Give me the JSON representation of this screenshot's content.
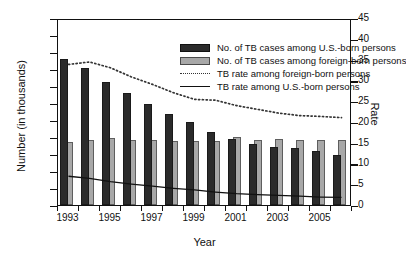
{
  "chart_data": {
    "type": "bar",
    "title": "",
    "xlabel": "Year",
    "ylabel": "Number (in thousands)",
    "ylabel_right": "Rate",
    "grid": false,
    "legend_position": "top-center",
    "ylim": [
      0,
      22
    ],
    "ylim_right": [
      0,
      45
    ],
    "ytick_step": 2,
    "ytick_right_step": 5,
    "yticks": [
      "22",
      "20",
      "18",
      "16",
      "14",
      "12",
      "10",
      "8",
      "6",
      "4",
      "2",
      "0"
    ],
    "yticks_right": [
      "45",
      "40",
      "35",
      "30",
      "25",
      "20",
      "15",
      "10",
      "5",
      "0"
    ],
    "categories": [
      1993,
      1994,
      1995,
      1996,
      1997,
      1998,
      1999,
      2000,
      2001,
      2002,
      2003,
      2004,
      2005,
      2006
    ],
    "xtick_labels": [
      "1993",
      "",
      "1995",
      "",
      "1997",
      "",
      "1999",
      "",
      "2001",
      "",
      "2003",
      "",
      "2005",
      ""
    ],
    "series": [
      {
        "name": "No. of TB cases among U.S.-born persons",
        "type": "bar",
        "axis": "left",
        "color": "#2b2b2b",
        "values": [
          17.2,
          16.1,
          14.5,
          13.2,
          11.9,
          10.7,
          9.8,
          8.6,
          7.8,
          7.2,
          6.8,
          6.7,
          6.3,
          5.9
        ]
      },
      {
        "name": "No. of TB cases among foreign-born persons",
        "type": "bar",
        "axis": "left",
        "color": "#a8a8a8",
        "values": [
          7.4,
          7.7,
          7.9,
          7.65,
          7.7,
          7.55,
          7.55,
          7.5,
          7.95,
          7.6,
          7.8,
          7.7,
          7.6,
          7.65
        ]
      },
      {
        "name": "TB rate among foreign-born persons",
        "type": "line",
        "style": "dotted",
        "axis": "right",
        "color": "#333333",
        "values": [
          34.3,
          34.9,
          33.5,
          31.3,
          29.5,
          27.5,
          25.9,
          25.7,
          24.4,
          23.5,
          22.6,
          22.0,
          21.8,
          21.5
        ]
      },
      {
        "name": "TB rate among U.S.-born persons",
        "type": "line",
        "style": "solid",
        "axis": "right",
        "color": "#111111",
        "values": [
          7.4,
          6.9,
          6.1,
          5.5,
          5.0,
          4.5,
          4.1,
          3.6,
          3.2,
          3.0,
          2.8,
          2.6,
          2.4,
          2.3
        ]
      }
    ],
    "legend": [
      {
        "label": "No. of TB cases among U.S.-born persons",
        "key": "dark-bar-swatch"
      },
      {
        "label": "No. of TB cases among foreign-born persons",
        "key": "gray-bar-swatch"
      },
      {
        "label": "TB rate among foreign-born persons",
        "key": "dotted-line-swatch"
      },
      {
        "label": "TB rate among U.S.-born persons",
        "key": "solid-line-swatch"
      }
    ]
  }
}
